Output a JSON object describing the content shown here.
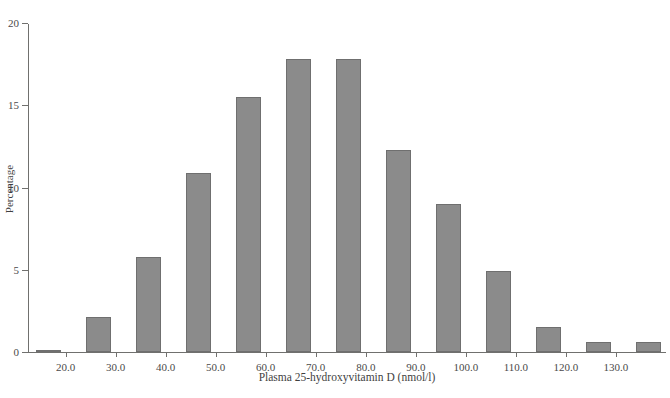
{
  "figure": {
    "top_caption": "",
    "bar_color": "#8b8b8b",
    "bar_border_color": "#6f6f6f",
    "axis_color": "#70706e"
  },
  "chart_data": {
    "type": "bar",
    "title": "",
    "xlabel": "Plasma 25-hydroxyvitamin D (nmol/l)",
    "ylabel": "Percentage",
    "grid": false,
    "legend": null,
    "xlim": [
      12.5,
      140.0
    ],
    "ylim": [
      0,
      20
    ],
    "xtick_labels": [
      "20.0",
      "30.0",
      "40.0",
      "50.0",
      "60.0",
      "70.0",
      "80.0",
      "90.0",
      "100.0",
      "110.0",
      "120.0",
      "130.0"
    ],
    "xtick_values": [
      20.0,
      30.0,
      40.0,
      50.0,
      60.0,
      70.0,
      80.0,
      90.0,
      100.0,
      110.0,
      120.0,
      130.0
    ],
    "ytick_labels": [
      "0",
      "5",
      "10",
      "15",
      "20"
    ],
    "ytick_values": [
      0,
      5,
      10,
      15,
      20
    ],
    "bin_width": 5,
    "bin_starts": [
      14.0,
      24.0,
      34.0,
      44.0,
      54.0,
      64.0,
      74.0,
      84.0,
      94.0,
      104.0,
      114.0,
      124.0,
      134.0
    ],
    "bin_centers": [
      16.5,
      26.5,
      36.5,
      46.5,
      56.5,
      66.5,
      76.5,
      86.5,
      96.5,
      106.5,
      116.5,
      126.5,
      136.5
    ],
    "values": [
      0.1,
      2.1,
      5.8,
      10.9,
      15.5,
      17.8,
      17.8,
      12.3,
      9.0,
      4.9,
      1.5,
      0.6,
      0.6
    ]
  }
}
